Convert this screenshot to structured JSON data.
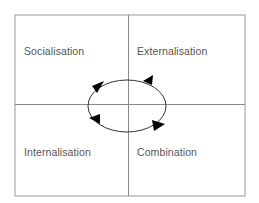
{
  "diagram": {
    "type": "quadrant-cycle",
    "quadrants": {
      "top_left": {
        "label": "Socialisation"
      },
      "top_right": {
        "label": "Externalisation"
      },
      "bottom_left": {
        "label": "Internalisation"
      },
      "bottom_right": {
        "label": "Combination"
      }
    },
    "cycle": {
      "shape": "ellipse",
      "direction": "counter-clockwise",
      "arrowheads": 4
    },
    "colors": {
      "frame": "#9a9a9a",
      "divider": "#8a8a8a",
      "cycle": "#333333",
      "arrowhead": "#000000",
      "text": "#555555"
    }
  }
}
